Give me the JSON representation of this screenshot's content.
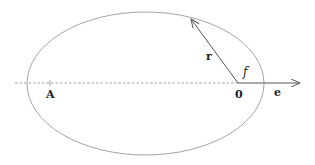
{
  "diagram": {
    "type": "orbital-ellipse",
    "labels": {
      "point_a": "A",
      "focus": "0",
      "radius_vector": "r",
      "eccentricity_vector": "e",
      "true_anomaly": "f"
    },
    "colors": {
      "ellipse": "#9a9a9a",
      "axis": "#8a8a8a",
      "arrow": "#555555",
      "text": "#222222"
    }
  }
}
